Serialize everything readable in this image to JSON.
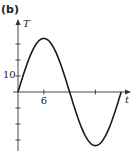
{
  "panel_label": "(b)",
  "chart_data": {
    "type": "line",
    "title": "",
    "xlabel": "t",
    "ylabel": "T",
    "x_tick_labels": [
      {
        "value": 6,
        "label": "6"
      }
    ],
    "x_ticks": [
      6,
      18
    ],
    "y_tick_labels": [
      {
        "value": 10,
        "label": "10"
      }
    ],
    "y_ticks": [
      -30,
      -20,
      -10,
      10,
      20,
      30
    ],
    "xlim": [
      0,
      26
    ],
    "ylim": [
      -36,
      44
    ],
    "grid": false,
    "legend": null,
    "series": [
      {
        "name": "T(t)",
        "function": "T = 33.5 sin(pi t / 12)",
        "x": [
          0,
          2,
          4,
          6,
          8,
          10,
          12,
          14,
          16,
          18,
          20,
          22,
          24
        ],
        "values": [
          0,
          16.8,
          29.0,
          33.5,
          29.0,
          16.8,
          0,
          -16.8,
          -29.0,
          -33.5,
          -29.0,
          -16.8,
          0
        ]
      }
    ],
    "colors": {
      "curve": "#1a1a1a",
      "axis": "#333333"
    }
  }
}
